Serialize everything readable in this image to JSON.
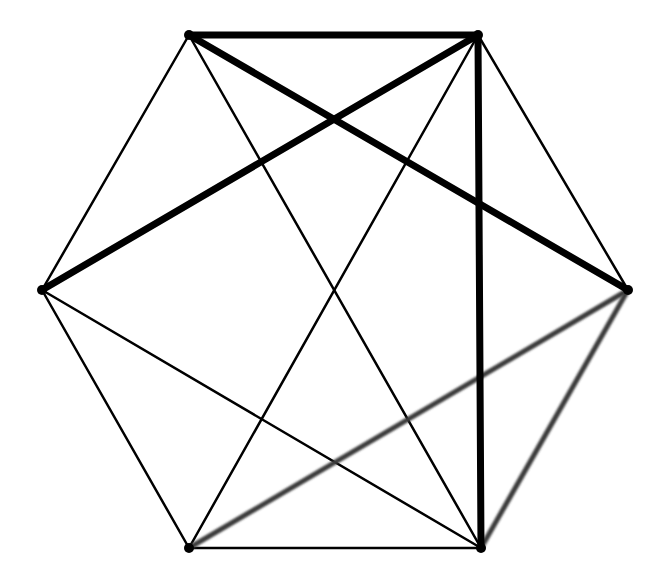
{
  "diagram": {
    "type": "complete-graph-K6",
    "vertices": [
      {
        "id": "TL",
        "x": 189,
        "y": 35
      },
      {
        "id": "TR",
        "x": 478,
        "y": 35
      },
      {
        "id": "L",
        "x": 42,
        "y": 290
      },
      {
        "id": "R",
        "x": 628,
        "y": 290
      },
      {
        "id": "BL",
        "x": 189,
        "y": 548
      },
      {
        "id": "BR",
        "x": 481,
        "y": 548
      }
    ],
    "styles": {
      "thick": {
        "color": "#000000",
        "width": 7
      },
      "gray": {
        "color": "#3a3a3a",
        "width": 5
      },
      "thin": {
        "color": "#000000",
        "width": 2.5
      }
    },
    "edges": [
      {
        "from": "TL",
        "to": "TR",
        "style": "thick"
      },
      {
        "from": "TL",
        "to": "R",
        "style": "thick"
      },
      {
        "from": "TR",
        "to": "L",
        "style": "thick"
      },
      {
        "from": "TR",
        "to": "BR",
        "style": "thick"
      },
      {
        "from": "TL",
        "to": "BL",
        "style": "gray"
      },
      {
        "from": "L",
        "to": "R",
        "style": "gray"
      },
      {
        "from": "R",
        "to": "BL",
        "style": "gray"
      },
      {
        "from": "R",
        "to": "BR",
        "style": "gray"
      },
      {
        "from": "TL",
        "to": "L",
        "style": "thin"
      },
      {
        "from": "TR",
        "to": "R",
        "style": "thin"
      },
      {
        "from": "L",
        "to": "BL",
        "style": "thin"
      },
      {
        "from": "BL",
        "to": "BR",
        "style": "thin"
      },
      {
        "from": "TL",
        "to": "BR",
        "style": "thin"
      },
      {
        "from": "TR",
        "to": "BL",
        "style": "thin"
      },
      {
        "from": "L",
        "to": "BR",
        "style": "thin"
      }
    ]
  }
}
